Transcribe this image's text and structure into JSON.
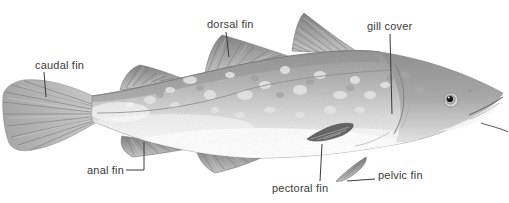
{
  "figure": {
    "kind": "labeled-anatomical-diagram",
    "background_color": "#ffffff",
    "text_color": "#3a3a3a",
    "leader_line_color": "#3a3a3a",
    "labels": [
      {
        "id": "caudal-fin",
        "text": "caudal fin"
      },
      {
        "id": "dorsal-fin",
        "text": "dorsal fin"
      },
      {
        "id": "gill-cover",
        "text": "gill cover"
      },
      {
        "id": "anal-fin",
        "text": "anal fin"
      },
      {
        "id": "pectoral-fin",
        "text": "pectoral fin"
      },
      {
        "id": "pelvic-fin",
        "text": "pelvic fin"
      }
    ]
  }
}
